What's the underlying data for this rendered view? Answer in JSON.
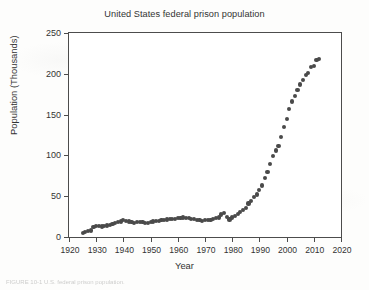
{
  "figure": {
    "caption": "FIGURE 10-1  U.S. federal prison population."
  },
  "chart_data": {
    "type": "scatter",
    "title": "United States federal prison population",
    "xlabel": "Year",
    "ylabel": "Population (Thousands)",
    "xlim": [
      1920,
      2020
    ],
    "ylim": [
      0,
      250
    ],
    "xticks": [
      1920,
      1930,
      1940,
      1950,
      1960,
      1970,
      1980,
      1990,
      2000,
      2010,
      2020
    ],
    "yticks": [
      0,
      50,
      100,
      150,
      200,
      250
    ],
    "grid": false,
    "legend": false,
    "marker": "filled-circle",
    "marker_color": "#4a4a4a",
    "x": [
      1925,
      1926,
      1927,
      1928,
      1929,
      1930,
      1931,
      1932,
      1933,
      1934,
      1935,
      1936,
      1937,
      1938,
      1939,
      1940,
      1941,
      1942,
      1943,
      1944,
      1945,
      1946,
      1947,
      1948,
      1949,
      1950,
      1951,
      1952,
      1953,
      1954,
      1955,
      1956,
      1957,
      1958,
      1959,
      1960,
      1961,
      1962,
      1963,
      1964,
      1965,
      1966,
      1967,
      1968,
      1969,
      1970,
      1971,
      1972,
      1973,
      1974,
      1975,
      1976,
      1977,
      1978,
      1979,
      1980,
      1981,
      1982,
      1983,
      1984,
      1985,
      1986,
      1987,
      1988,
      1989,
      1990,
      1991,
      1992,
      1993,
      1994,
      1995,
      1996,
      1997,
      1998,
      1999,
      2000,
      2001,
      2002,
      2003,
      2004,
      2005,
      2006,
      2007,
      2008,
      2009,
      2010,
      2011,
      2012
    ],
    "values": [
      5.2,
      6.5,
      7.2,
      8.0,
      12.0,
      13.0,
      13.5,
      12.8,
      13.2,
      14.0,
      15.0,
      16.0,
      17.0,
      18.5,
      19.0,
      20.5,
      20.0,
      19.0,
      18.0,
      17.5,
      18.0,
      18.5,
      18.0,
      17.5,
      17.0,
      18.0,
      19.0,
      19.5,
      20.0,
      20.5,
      21.0,
      21.5,
      21.8,
      22.0,
      22.5,
      23.0,
      23.5,
      24.0,
      23.5,
      23.0,
      22.5,
      22.0,
      21.0,
      20.5,
      20.0,
      20.5,
      20.5,
      21.0,
      22.0,
      23.0,
      24.0,
      27.5,
      29.0,
      25.0,
      21.5,
      24.0,
      26.0,
      28.5,
      31.0,
      33.0,
      36.0,
      41.0,
      44.0,
      49.0,
      52.0,
      58.0,
      63.0,
      72.0,
      80.0,
      89.0,
      99.0,
      106.0,
      112.0,
      123.0,
      135.0,
      145.0,
      157.0,
      166.0,
      173.0,
      180.0,
      187.0,
      192.0,
      199.0,
      201.0,
      208.0,
      210.0,
      217.0,
      218.0
    ]
  }
}
